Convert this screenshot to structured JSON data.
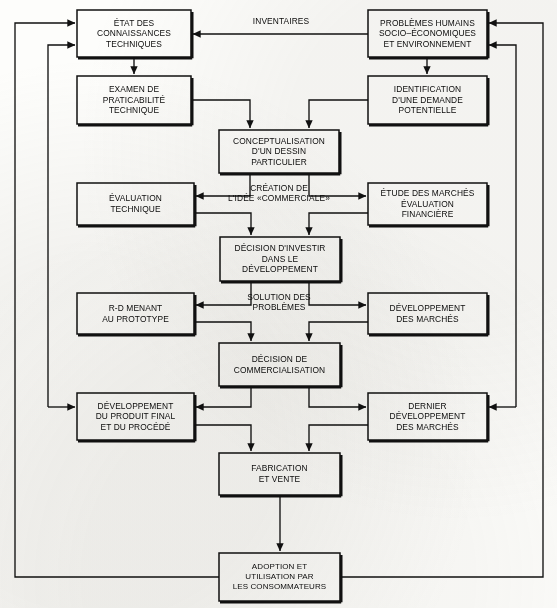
{
  "diagram": {
    "language": "fr",
    "stroke_color": "#111111",
    "background_color": "#fdfdfb",
    "boxes": [
      {
        "id": "etat",
        "lines": [
          "ÉTAT DES",
          "CONNAISSANCES",
          "TECHNIQUES"
        ]
      },
      {
        "id": "problemes",
        "lines": [
          "PROBLÈMES HUMAINS",
          "SOCIO–ÉCONOMIQUES",
          "ET ENVIRONNEMENT"
        ]
      },
      {
        "id": "examen",
        "lines": [
          "EXAMEN DE",
          "PRATICABILITÉ",
          "TECHNIQUE"
        ]
      },
      {
        "id": "identif",
        "lines": [
          "IDENTIFICATION",
          "D'UNE DEMANDE",
          "POTENTIELLE"
        ]
      },
      {
        "id": "concept",
        "lines": [
          "CONCEPTUALISATION",
          "D'UN DESSIN",
          "PARTICULIER"
        ]
      },
      {
        "id": "evaltech",
        "lines": [
          "ÉVALUATION",
          "TECHNIQUE"
        ]
      },
      {
        "id": "etude",
        "lines": [
          "ÉTUDE DES MARCHÉS",
          "ÉVALUATION",
          "FINANCIÈRE"
        ]
      },
      {
        "id": "investir",
        "lines": [
          "DÉCISION D'INVESTIR",
          "DANS LE",
          "DÉVELOPPEMENT"
        ]
      },
      {
        "id": "rd",
        "lines": [
          "R-D MENANT",
          "AU PROTOTYPE"
        ]
      },
      {
        "id": "devmarches",
        "lines": [
          "DÉVELOPPEMENT",
          "DES MARCHÉS"
        ]
      },
      {
        "id": "commercial",
        "lines": [
          "DÉCISION DE",
          "COMMERCIALISATION"
        ]
      },
      {
        "id": "produitfinal",
        "lines": [
          "DÉVELOPPEMENT",
          "DU PRODUIT FINAL",
          "ET DU PROCÉDÉ"
        ]
      },
      {
        "id": "dernier",
        "lines": [
          "DERNIER",
          "DÉVELOPPEMENT",
          "DES MARCHÉS"
        ]
      },
      {
        "id": "fabrication",
        "lines": [
          "FABRICATION",
          "ET VENTE"
        ]
      },
      {
        "id": "adoption",
        "lines": [
          "ADOPTION ET",
          "UTILISATION PAR",
          "LES CONSOMMATEURS"
        ]
      }
    ],
    "edge_labels": [
      {
        "id": "inventaires",
        "lines": [
          "INVENTAIRES"
        ]
      },
      {
        "id": "creation",
        "lines": [
          "CRÉATION DE",
          "L'IDÉE «COMMERCIALE»"
        ]
      },
      {
        "id": "solution",
        "lines": [
          "SOLUTION DES",
          "PROBLÈMES"
        ]
      }
    ]
  }
}
